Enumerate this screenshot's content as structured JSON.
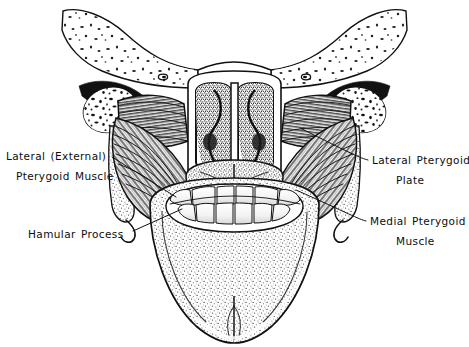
{
  "figure": {
    "background_color": "#ffffff",
    "ink_color": "#111111",
    "style": "black and white pen-and-ink anatomical line drawing"
  },
  "labels": [
    {
      "id": "lateral-external-pterygoid-muscle",
      "line1": "Lateral  (External)",
      "line2": "Pterygoid Muscle",
      "side": "left",
      "text_x": 6,
      "text_y": 160,
      "leader_start_x": 112,
      "leader_start_y": 157,
      "leader_end_x": 175,
      "leader_end_y": 196
    },
    {
      "id": "hamular-process",
      "line1": "Hamular Process",
      "line2": "",
      "side": "left",
      "text_x": 28,
      "text_y": 238,
      "leader_start_x": 133,
      "leader_start_y": 231,
      "leader_end_x": 181,
      "leader_end_y": 209
    },
    {
      "id": "lateral-pterygoid-plate",
      "line1": "Lateral  Pterygoid",
      "line2": "Plate",
      "side": "right",
      "text_x": 372,
      "text_y": 164,
      "leader_start_x": 368,
      "leader_start_y": 160,
      "leader_end_x": 300,
      "leader_end_y": 128
    },
    {
      "id": "medial-pterygoid-muscle",
      "line1": "Medial  Pterygoid",
      "line2": "Muscle",
      "side": "right",
      "text_x": 370,
      "text_y": 225,
      "leader_start_x": 366,
      "leader_start_y": 221,
      "leader_end_x": 296,
      "leader_end_y": 190
    }
  ],
  "structures": {
    "cranial_base": "skull base with stippled cancellous bone",
    "mandibular_condyle_left": "left condyle cross-section",
    "mandibular_condyle_right": "right condyle cross-section",
    "choanae": "paired posterior nasal apertures with turbinates",
    "vomer": "midline nasal septum",
    "soft_palate": "soft palate and tongue dorsum with median raphe",
    "dental_arch": "mandibular dental arch with teeth",
    "lateral_pterygoid_left": "horizontal fibered muscle belly, upper left",
    "lateral_pterygoid_right": "horizontal fibered muscle belly, upper right",
    "medial_pterygoid_left": "diagonal fibered muscle belly, lower left",
    "medial_pterygoid_right": "diagonal fibered muscle belly, lower right",
    "mandible_body": "mandibular body and symphysis"
  }
}
